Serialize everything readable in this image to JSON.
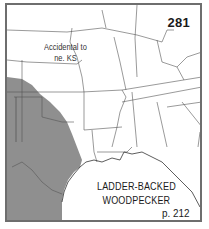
{
  "map": {
    "number": "281",
    "note": {
      "line1": "Accidental to",
      "line2": "ne. KS"
    },
    "species": {
      "line1": "LADDER-BACKED",
      "line2": "WOODPECKER"
    },
    "page_ref": "p. 212",
    "colors": {
      "range_fill": "#8f8f8f",
      "border": "#6e6e6e",
      "state_lines": "#555555",
      "background": "#ffffff"
    },
    "range_region": "Texas / southern Great Plains (shaded)"
  }
}
